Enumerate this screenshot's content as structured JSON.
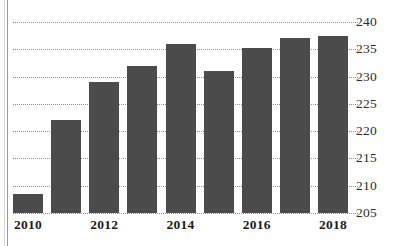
{
  "chart_data": {
    "type": "bar",
    "title": "",
    "subtitle": "",
    "xlabel": "",
    "ylabel": "",
    "categories": [
      "2010",
      "2011",
      "2012",
      "2013",
      "2014",
      "2015",
      "2016",
      "2017",
      "2018"
    ],
    "values": [
      208.5,
      222,
      229,
      232,
      236,
      231,
      235.2,
      237,
      237.5
    ],
    "ylim": [
      205,
      240
    ],
    "yticks": [
      205,
      210,
      215,
      220,
      225,
      230,
      235,
      240
    ],
    "ytick_labels": [
      "205",
      "210",
      "215",
      "220",
      "225",
      "230",
      "235",
      "240"
    ],
    "xtick_labels": [
      "2010",
      "2012",
      "2014",
      "2016",
      "2018"
    ],
    "xtick_indices": [
      0,
      2,
      4,
      6,
      8
    ],
    "grid": true,
    "grid_style": "dotted",
    "legend": null,
    "legend_position": "none",
    "bar_color": "#4b4b4b",
    "grid_color": "#8d8d8d",
    "text_color": "#1c1c1c",
    "background_color": "#ffffff"
  }
}
